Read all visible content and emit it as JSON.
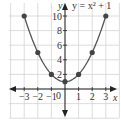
{
  "chart_data": {
    "type": "line",
    "title": "",
    "annotation": "y = x² + 1",
    "xlabel": "x",
    "ylabel": "y",
    "x": [
      -3,
      -2,
      -1,
      0,
      1,
      2,
      3
    ],
    "series": [
      {
        "name": "y = x^2 + 1",
        "values": [
          10,
          5,
          2,
          1,
          2,
          5,
          10
        ]
      }
    ],
    "xlim": [
      -4,
      4
    ],
    "ylim": [
      -4,
      12
    ],
    "x_ticks": [
      "-3",
      "-2",
      "-1",
      "1",
      "2",
      "3"
    ],
    "y_ticks": [
      "2",
      "4",
      "6",
      "8",
      "10"
    ],
    "origin_label": "0",
    "grid": true,
    "legend": "none",
    "colors": {
      "curve": "#555555",
      "grid": "#cfcfcf",
      "axis": "#222222"
    }
  }
}
